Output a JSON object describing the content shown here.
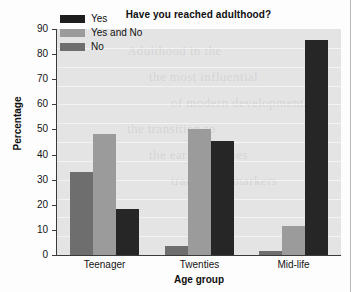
{
  "chart_data": {
    "type": "bar",
    "title": "Have you reached adulthood?",
    "xlabel": "Age group",
    "ylabel": "Percentage",
    "categories": [
      "Teenager",
      "Twenties",
      "Mid-life"
    ],
    "series": [
      {
        "name": "No",
        "color": "#6e6e6e",
        "values": [
          33,
          3.5,
          1.5
        ]
      },
      {
        "name": "Yes and No",
        "color": "#9b9b9b",
        "values": [
          48,
          50,
          11.5
        ]
      },
      {
        "name": "Yes",
        "color": "#262626",
        "values": [
          18.5,
          45.5,
          85.5
        ]
      }
    ],
    "legend_order": [
      "Yes",
      "Yes and No",
      "No"
    ],
    "legend_position": "top-left-inside",
    "ylim": [
      0,
      90
    ],
    "yticks": [
      0,
      10,
      20,
      30,
      40,
      50,
      60,
      70,
      80,
      90
    ],
    "ytick_labels": [
      "0",
      "10",
      "20",
      "30",
      "40",
      "50",
      "60",
      "70",
      "80",
      "90"
    ],
    "grid": false,
    "plot_background": "#e4e4e4"
  },
  "ghost_text": [
    "Adulthood in the",
    "the most influential",
    "of modern developmental",
    "the transition to",
    "the early twenties",
    "traditional markers"
  ]
}
